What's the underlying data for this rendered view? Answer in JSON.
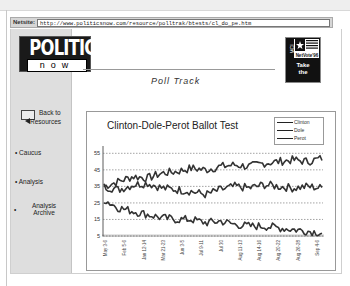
{
  "browser": {
    "address_label": "Netsite:",
    "url": "http://www.politicsnow.com/resource/polltrak/btests/cl_do_pe.htm"
  },
  "logo": {
    "top": "POLITICS",
    "bottom": "now"
  },
  "header": {
    "section_title": "Poll Track"
  },
  "badge": {
    "flag_label": "NetVote'96",
    "side_label": "MCI",
    "text_line1": "Take",
    "text_line2": "the"
  },
  "sidebar": {
    "back": {
      "icon": "left-arrow-icon",
      "line1": "Back to",
      "line2": "Resources"
    },
    "items": [
      {
        "label": "Caucus"
      },
      {
        "label": "Analysis"
      },
      {
        "label": "Analysis",
        "label2": "Archive"
      }
    ]
  },
  "chart_data": {
    "type": "line",
    "title": "Clinton-Dole-Perot Ballot Test",
    "xlabel": "",
    "ylabel": "",
    "ylim": [
      5,
      57
    ],
    "yticks": [
      5,
      15,
      25,
      35,
      45,
      55
    ],
    "grid": "horizontal dotted",
    "legend_position": "top-right",
    "legend": [
      "Clinton",
      "Dole",
      "Perot"
    ],
    "x_tick_labels": [
      "May 3-6",
      "Feb 5-6",
      "Jan 12-14",
      "Mar 21-23",
      "Jun 3-5",
      "Jul 9-11",
      "Jul 30",
      "Aug 11-13",
      "Aug 14-16",
      "Aug 20-22",
      "Aug 26-28",
      "Sep 4-6"
    ],
    "series": [
      {
        "name": "Clinton",
        "values": [
          35,
          38,
          41,
          40,
          43,
          44,
          46,
          45,
          47,
          48,
          47,
          49,
          50,
          51,
          50,
          52
        ]
      },
      {
        "name": "Dole",
        "values": [
          35,
          33,
          36,
          37,
          34,
          33,
          32,
          30,
          33,
          35,
          34,
          36,
          35,
          34,
          35,
          34
        ]
      },
      {
        "name": "Perot",
        "values": [
          27,
          22,
          20,
          18,
          16,
          15,
          15,
          13,
          14,
          12,
          11,
          11,
          10,
          9,
          8,
          7
        ]
      }
    ]
  }
}
